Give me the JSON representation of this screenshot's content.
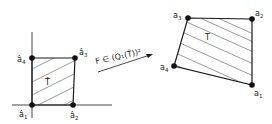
{
  "reference_element": {
    "name": "T̂",
    "vertices": [
      {
        "id": "a1_hat",
        "base": "â",
        "sub": "1",
        "x": 32,
        "y": 105
      },
      {
        "id": "a2_hat",
        "base": "â",
        "sub": "2",
        "x": 73,
        "y": 105
      },
      {
        "id": "a3_hat",
        "base": "â",
        "sub": "3",
        "x": 75,
        "y": 58
      },
      {
        "id": "a4_hat",
        "base": "â",
        "sub": "4",
        "x": 32,
        "y": 58
      }
    ]
  },
  "physical_element": {
    "name": "T",
    "vertices": [
      {
        "id": "a1",
        "base": "a",
        "sub": "1",
        "x": 252,
        "y": 85
      },
      {
        "id": "a2",
        "base": "a",
        "sub": "2",
        "x": 252,
        "y": 19
      },
      {
        "id": "a3",
        "base": "a",
        "sub": "3",
        "x": 188,
        "y": 18
      },
      {
        "id": "a4",
        "base": "a",
        "sub": "4",
        "x": 174,
        "y": 66
      }
    ]
  },
  "mapping": {
    "label": "F ∈ (Q₁(T̂))²"
  },
  "colors": {
    "stroke": "#1a1a1a",
    "hatch": "#555555",
    "background": "#ffffff"
  }
}
